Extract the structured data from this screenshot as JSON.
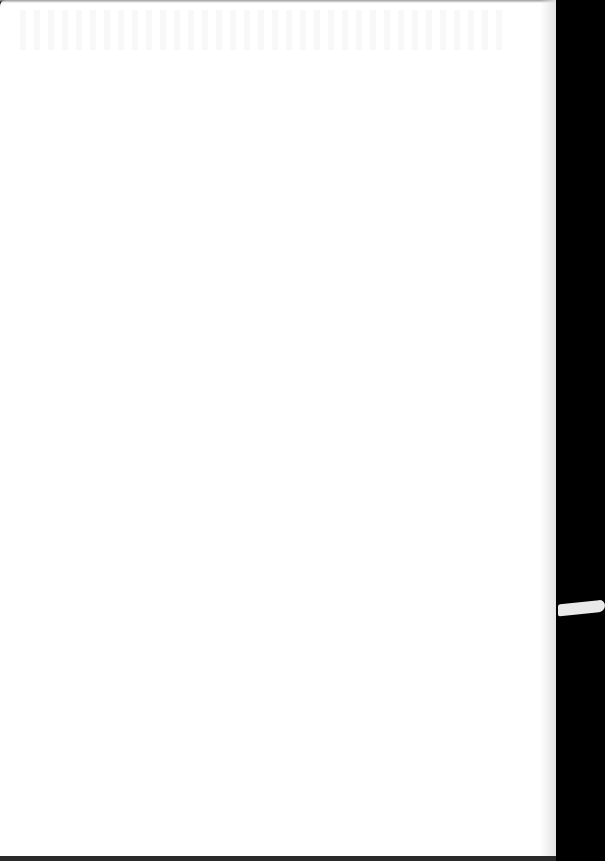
{
  "document": {
    "type": "blank scanned page",
    "text": "",
    "background_color": "#ffffff",
    "surround_color": "#000000"
  }
}
